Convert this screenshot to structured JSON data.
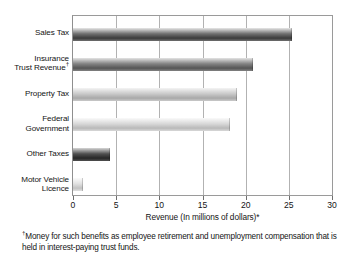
{
  "chart_data": {
    "type": "bar",
    "orientation": "horizontal",
    "title": "",
    "xlabel": "Revenue (In millions of dollars)*",
    "ylabel": "",
    "xlim": [
      0,
      30
    ],
    "xticks": [
      0,
      5,
      10,
      15,
      20,
      25,
      30
    ],
    "xtick_labels": [
      "0",
      "5",
      "10",
      "15",
      "20",
      "25",
      "30"
    ],
    "grid": true,
    "grid_axis": "x",
    "legend": "none",
    "categories": [
      "Sales Tax",
      "Insurance Trust Revenue†",
      "Property Tax",
      "Federal Government",
      "Other Taxes",
      "Motor Vehicle Licence"
    ],
    "values": [
      25.4,
      20.9,
      19.0,
      18.2,
      4.3,
      1.2
    ],
    "bars": [
      {
        "label_lines": [
          "Sales Tax"
        ],
        "dagger": false,
        "value": 25.4,
        "color_top": "#e8e8e8",
        "color_mid": "#6f6f6f",
        "color_bottom": "#3b3b3b"
      },
      {
        "label_lines": [
          "Insurance",
          "Trust Revenue"
        ],
        "dagger": true,
        "value": 20.9,
        "color_top": "#e4e4e4",
        "color_mid": "#828282",
        "color_bottom": "#555555"
      },
      {
        "label_lines": [
          "Property Tax"
        ],
        "dagger": false,
        "value": 19.0,
        "color_top": "#f4f4f4",
        "color_mid": "#c9c9c9",
        "color_bottom": "#a8a8a8"
      },
      {
        "label_lines": [
          "Federal",
          "Government"
        ],
        "dagger": false,
        "value": 18.2,
        "color_top": "#fafafa",
        "color_mid": "#d8d8d8",
        "color_bottom": "#b9b9b9"
      },
      {
        "label_lines": [
          "Other Taxes"
        ],
        "dagger": false,
        "value": 4.3,
        "color_top": "#d6d6d6",
        "color_mid": "#505050",
        "color_bottom": "#272727"
      },
      {
        "label_lines": [
          "Motor Vehicle",
          "Licence"
        ],
        "dagger": false,
        "value": 1.2,
        "color_top": "#fbfbfb",
        "color_mid": "#e0e0e0",
        "color_bottom": "#c2c2c2"
      }
    ],
    "annotations": {
      "footnote_marker": "†",
      "footnote": "Money for such benefits as employee retirement and unemployment compensation that is held in interest-paying trust funds."
    }
  }
}
